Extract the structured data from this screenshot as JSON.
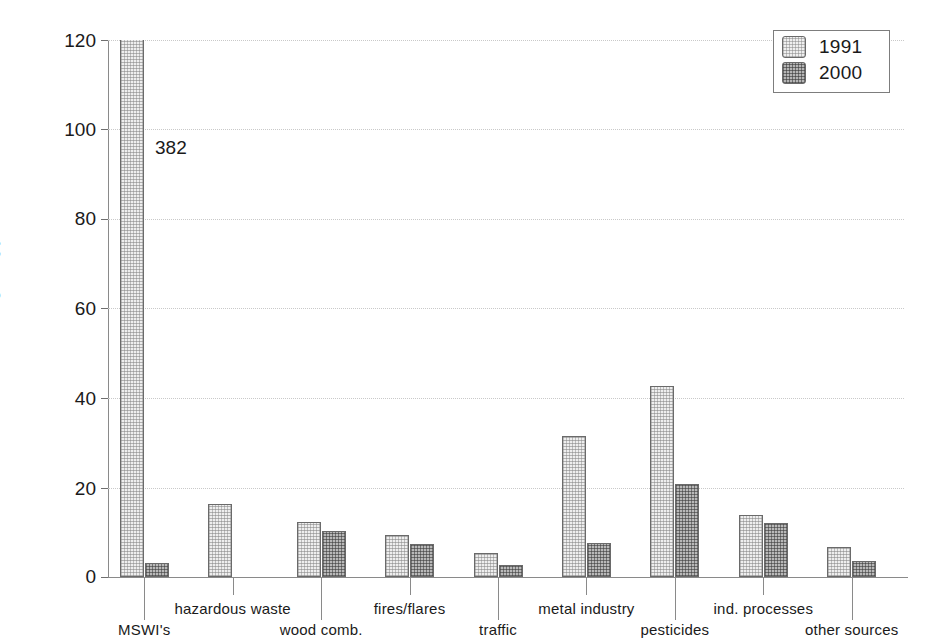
{
  "chart_data": {
    "type": "bar",
    "title": "",
    "subtitle": "",
    "xlabel": "",
    "ylabel": "g TEQ/year",
    "ylim": [
      0,
      120
    ],
    "yticks": [
      0,
      20,
      40,
      60,
      80,
      100,
      120
    ],
    "ytick_labels": [
      "0",
      "20",
      "40",
      "60",
      "80",
      "100",
      "120"
    ],
    "grid": true,
    "grid_axis": "y",
    "legend_position": "top-right",
    "categories": [
      "MSWI's",
      "hazardous waste",
      "wood comb.",
      "fires/flares",
      "traffic",
      "metal industry",
      "pesticides",
      "ind. processes",
      "other sources"
    ],
    "series": [
      {
        "name": "1991",
        "color": "#eeeeee",
        "values": [
          382,
          16.4,
          12.4,
          9.4,
          5.4,
          31.6,
          42.6,
          13.9,
          6.7
        ]
      },
      {
        "name": "2000",
        "color": "#b9b9b9",
        "values": [
          3.2,
          0,
          10.3,
          7.3,
          2.6,
          7.6,
          20.7,
          12.0,
          3.6
        ]
      }
    ],
    "annotations": [
      {
        "text": "382",
        "x_category": "MSWI's",
        "series": "1991",
        "note": "value label for clipped 1991 MSWI's bar"
      }
    ]
  },
  "legend": {
    "entries": [
      {
        "label": "1991"
      },
      {
        "label": "2000"
      }
    ]
  },
  "axis": {
    "y_title": "g TEQ/year",
    "y_tick_labels": [
      "120",
      "100",
      "80",
      "60",
      "40",
      "20",
      "0"
    ],
    "x_tick_labels": [
      "MSWI's",
      "hazardous waste",
      "wood comb.",
      "fires/flares",
      "traffic",
      "metal industry",
      "pesticides",
      "ind. processes",
      "other sources"
    ]
  }
}
